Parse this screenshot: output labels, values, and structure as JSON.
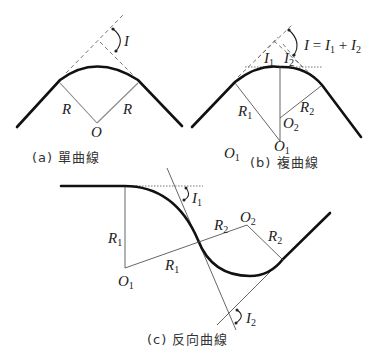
{
  "figure": {
    "panel_a": {
      "caption": "(a) 單曲線",
      "angle_label": "I",
      "radius_left": "R",
      "radius_right": "R",
      "center": "O"
    },
    "panel_b": {
      "caption": "(b) 複曲線",
      "equation": {
        "lhs": "I",
        "eq": " = ",
        "t1": "I",
        "t1_sub": "1",
        "plus": " + ",
        "t2": "I",
        "t2_sub": "2"
      },
      "angle1": {
        "main": "I",
        "sub": "1"
      },
      "angle2": {
        "main": "I",
        "sub": "2"
      },
      "radius1": {
        "main": "R",
        "sub": "1"
      },
      "radius2": {
        "main": "R",
        "sub": "2"
      },
      "center1": {
        "main": "O",
        "sub": "1"
      },
      "center2": {
        "main": "O",
        "sub": "2"
      },
      "stray_center": {
        "main": "O",
        "sub": "1"
      }
    },
    "panel_c": {
      "caption": "(c) 反向曲線",
      "angle1": {
        "main": "I",
        "sub": "1"
      },
      "angle2": {
        "main": "I",
        "sub": "2"
      },
      "radius1_vertical": {
        "main": "R",
        "sub": "1"
      },
      "radius1_diag": {
        "main": "R",
        "sub": "1"
      },
      "radius2_diag": {
        "main": "R",
        "sub": "2"
      },
      "radius2_right": {
        "main": "R",
        "sub": "2"
      },
      "center1": {
        "main": "O",
        "sub": "1"
      },
      "center2": {
        "main": "O",
        "sub": "2"
      }
    }
  }
}
